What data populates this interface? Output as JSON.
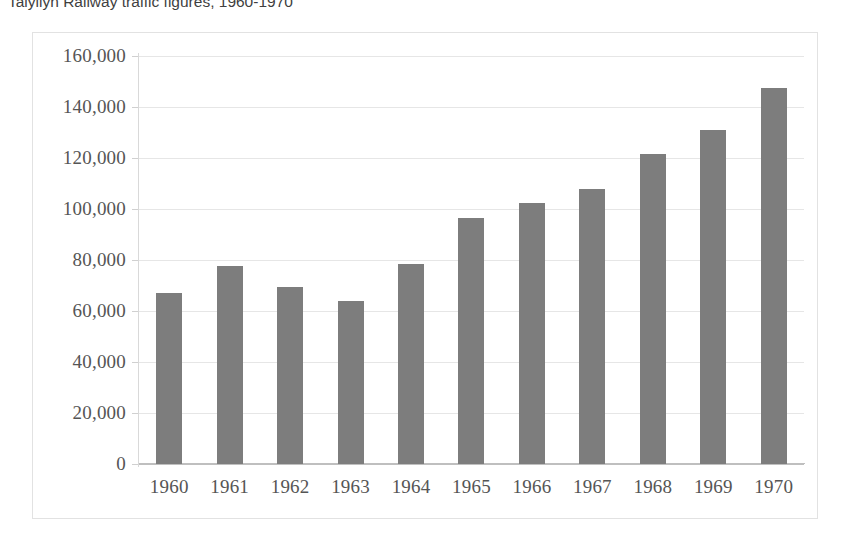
{
  "title": {
    "text": "Talyllyn Railway traffic figures, 1960-1970"
  },
  "colors": {
    "bar": "#7d7d7d",
    "gridline": "#e6e6e6",
    "axis": "#bfbfbf",
    "frame": "#e2e2e2",
    "label": "#555555"
  },
  "chart_data": {
    "type": "bar",
    "title": "Talyllyn Railway traffic figures, 1960-1970",
    "xlabel": "",
    "ylabel": "",
    "ylim": [
      0,
      160000
    ],
    "ytick_step": 20000,
    "ytick_labels": [
      "0",
      "20,000",
      "40,000",
      "60,000",
      "80,000",
      "100,000",
      "120,000",
      "140,000",
      "160,000"
    ],
    "ytick_values": [
      0,
      20000,
      40000,
      60000,
      80000,
      100000,
      120000,
      140000,
      160000
    ],
    "grid": true,
    "legend": false,
    "categories": [
      "1960",
      "1961",
      "1962",
      "1963",
      "1964",
      "1965",
      "1966",
      "1967",
      "1968",
      "1969",
      "1970"
    ],
    "values": [
      67000,
      77500,
      69500,
      64000,
      78500,
      96500,
      102500,
      108000,
      121500,
      131000,
      147500
    ]
  }
}
